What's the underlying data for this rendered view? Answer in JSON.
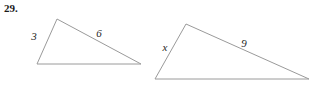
{
  "figure": {
    "problem_number": "29.",
    "stroke_color": "#9a9a9a",
    "background_color": "#ffffff",
    "label_color": "#262626",
    "triangles": [
      {
        "name": "small-triangle",
        "vertices": [
          {
            "name": "bottom-left",
            "x": 37,
            "y": 64
          },
          {
            "name": "apex",
            "x": 57,
            "y": 19
          },
          {
            "name": "bottom-right",
            "x": 141,
            "y": 64
          }
        ],
        "labels": [
          {
            "name": "side-label-3",
            "text": "3",
            "x": 34,
            "y": 36
          },
          {
            "name": "side-label-6",
            "text": "6",
            "x": 99,
            "y": 33
          }
        ]
      },
      {
        "name": "large-triangle",
        "vertices": [
          {
            "name": "bottom-left",
            "x": 155,
            "y": 79
          },
          {
            "name": "apex",
            "x": 186,
            "y": 24
          },
          {
            "name": "bottom-right",
            "x": 309,
            "y": 79
          }
        ],
        "labels": [
          {
            "name": "side-label-x",
            "text": "x",
            "x": 165,
            "y": 47
          },
          {
            "name": "side-label-9",
            "text": "9",
            "x": 244,
            "y": 43
          }
        ]
      }
    ]
  }
}
